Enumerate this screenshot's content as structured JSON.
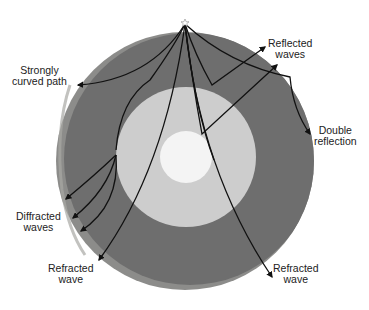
{
  "diagram": {
    "colors": {
      "background": "#ffffff",
      "mantle": "#6e6e6e",
      "crust": "#9a9a98",
      "outer_core": "#cdcdcd",
      "inner_core": "#f4f4f4",
      "wave_path": "#111111",
      "label_text": "#222222"
    },
    "source_icon": "star-icon",
    "labels": {
      "strongly_curved": {
        "line1": "Strongly",
        "line2": "curved path"
      },
      "reflected": {
        "line1": "Reflected",
        "line2": "waves"
      },
      "double_reflection": {
        "line1": "Double",
        "line2": "reflection"
      },
      "diffracted": {
        "line1": "Diffracted",
        "line2": "waves"
      },
      "refracted_left": {
        "line1": "Refracted",
        "line2": "wave"
      },
      "refracted_right": {
        "line1": "Refracted",
        "line2": "wave"
      }
    }
  }
}
